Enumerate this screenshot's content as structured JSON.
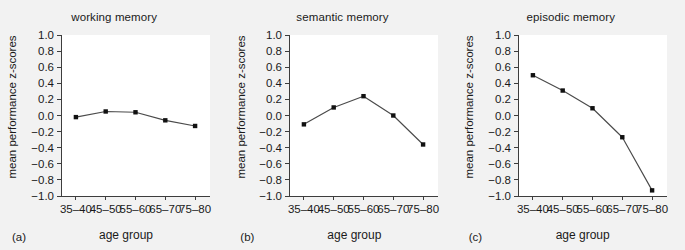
{
  "figure": {
    "background_color": "#f2f2f2",
    "panel_background_color": "#ffffff",
    "line_color": "#4a4a4a",
    "marker_color": "#111111",
    "axis_color": "#3d3d3d"
  },
  "chart_data": [
    {
      "type": "line",
      "title": "working memory",
      "panel_letter": "(a)",
      "xlabel": "age group",
      "ylabel": "mean performance z-scores",
      "categories": [
        "35-40",
        "45-50",
        "55-60",
        "65-70",
        "75-80"
      ],
      "values": [
        -0.02,
        0.05,
        0.04,
        -0.06,
        -0.13
      ],
      "ylim": [
        -1.0,
        1.0
      ],
      "yticks": [
        "1.0",
        "0.8",
        "0.6",
        "0.4",
        "0.2",
        "0.0",
        "-0.2",
        "-0.4",
        "-0.6",
        "-0.8",
        "-1.0"
      ],
      "ytick_values": [
        1.0,
        0.8,
        0.6,
        0.4,
        0.2,
        0.0,
        -0.2,
        -0.4,
        -0.6,
        -0.8,
        -1.0
      ],
      "grid": false,
      "legend": "none"
    },
    {
      "type": "line",
      "title": "semantic memory",
      "panel_letter": "(b)",
      "xlabel": "age group",
      "ylabel": "mean performance z-scores",
      "categories": [
        "35-40",
        "45-50",
        "55-60",
        "65-70",
        "75-80"
      ],
      "values": [
        -0.11,
        0.1,
        0.24,
        0.0,
        -0.36
      ],
      "ylim": [
        -1.0,
        1.0
      ],
      "yticks": [
        "1.0",
        "0.8",
        "0.6",
        "0.4",
        "0.2",
        "0.0",
        "-0.2",
        "-0.4",
        "-0.6",
        "-0.8",
        "-1.0"
      ],
      "ytick_values": [
        1.0,
        0.8,
        0.6,
        0.4,
        0.2,
        0.0,
        -0.2,
        -0.4,
        -0.6,
        -0.8,
        -1.0
      ],
      "grid": false,
      "legend": "none"
    },
    {
      "type": "line",
      "title": "episodic memory",
      "panel_letter": "(c)",
      "xlabel": "age group",
      "ylabel": "mean performance z-scores",
      "categories": [
        "35-40",
        "45-50",
        "55-60",
        "65-70",
        "75-80"
      ],
      "values": [
        0.5,
        0.31,
        0.09,
        -0.27,
        -0.93
      ],
      "ylim": [
        -1.0,
        1.0
      ],
      "yticks": [
        "1.0",
        "0.8",
        "0.6",
        "0.4",
        "0.2",
        "0.0",
        "-0.2",
        "-0.4",
        "-0.6",
        "-0.8",
        "-1.0"
      ],
      "ytick_values": [
        1.0,
        0.8,
        0.6,
        0.4,
        0.2,
        0.0,
        -0.2,
        -0.4,
        -0.6,
        -0.8,
        -1.0
      ],
      "grid": false,
      "legend": "none"
    }
  ]
}
